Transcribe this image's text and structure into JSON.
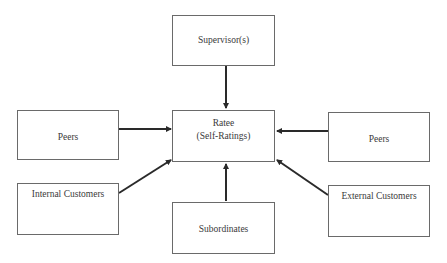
{
  "diagram": {
    "center": {
      "line1": "Ratee",
      "line2": "(Self-Ratings)"
    },
    "nodes": {
      "top": "Supervisor(s)",
      "left": "Peers",
      "right": "Peers",
      "bottom_left": "Internal Customers",
      "bottom_right": "External Customers",
      "bottom": "Subordinates"
    },
    "edges": [
      {
        "from": "Supervisor(s)",
        "to": "Ratee"
      },
      {
        "from": "Peers (left)",
        "to": "Ratee"
      },
      {
        "from": "Peers (right)",
        "to": "Ratee"
      },
      {
        "from": "Internal Customers",
        "to": "Ratee"
      },
      {
        "from": "External Customers",
        "to": "Ratee"
      },
      {
        "from": "Subordinates",
        "to": "Ratee"
      }
    ],
    "colors": {
      "stroke": "#2a2a2a",
      "border": "#6a6a6a",
      "text": "#3a3a3a"
    }
  }
}
